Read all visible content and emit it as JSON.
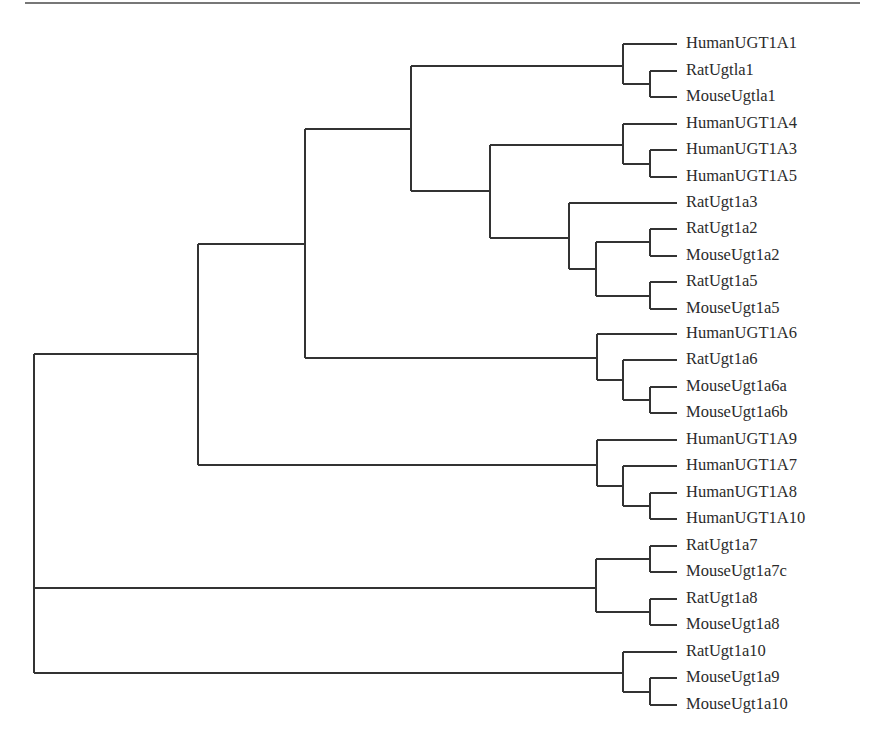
{
  "figure": {
    "type": "phylogenetic-tree",
    "orientation": "left-to-right",
    "line_color": "#333333",
    "top_rule": {
      "x1": 25,
      "x2": 860,
      "y": 3
    }
  },
  "leaves": [
    {
      "label": "HumanUGT1A1",
      "y": 44
    },
    {
      "label": "RatUgtla1",
      "y": 71
    },
    {
      "label": "MouseUgtla1",
      "y": 97
    },
    {
      "label": "HumanUGT1A4",
      "y": 124
    },
    {
      "label": "HumanUGT1A3",
      "y": 150
    },
    {
      "label": "HumanUGT1A5",
      "y": 177
    },
    {
      "label": "RatUgt1a3",
      "y": 203
    },
    {
      "label": "RatUgt1a2",
      "y": 229
    },
    {
      "label": "MouseUgt1a2",
      "y": 256
    },
    {
      "label": "RatUgt1a5",
      "y": 282
    },
    {
      "label": "MouseUgt1a5",
      "y": 309
    },
    {
      "label": "HumanUGT1A6",
      "y": 334
    },
    {
      "label": "RatUgt1a6",
      "y": 360
    },
    {
      "label": "MouseUgt1a6a",
      "y": 387
    },
    {
      "label": "MouseUgt1a6b",
      "y": 413
    },
    {
      "label": "HumanUGT1A9",
      "y": 440
    },
    {
      "label": "HumanUGT1A7",
      "y": 466
    },
    {
      "label": "HumanUGT1A8",
      "y": 493
    },
    {
      "label": "HumanUGT1A10",
      "y": 519
    },
    {
      "label": "RatUgt1a7",
      "y": 546
    },
    {
      "label": "MouseUgt1a7c",
      "y": 572
    },
    {
      "label": "RatUgt1a8",
      "y": 599
    },
    {
      "label": "MouseUgt1a8",
      "y": 625
    },
    {
      "label": "RatUgt1a10",
      "y": 652
    },
    {
      "label": "MouseUgt1a9",
      "y": 678
    },
    {
      "label": "MouseUgt1a10",
      "y": 705
    }
  ],
  "leaf_tip_x": 677,
  "label_x": 686,
  "nodes": [
    {
      "id": "root",
      "x": 34,
      "y_top": 354,
      "y_bottom": 673,
      "children": [
        {
          "y": 354,
          "to_x": 198
        },
        {
          "y": 588,
          "to_x": 596
        },
        {
          "y": 673,
          "to_x": 623
        }
      ]
    },
    {
      "id": "n198",
      "x": 198,
      "y_top": 244,
      "y_bottom": 465,
      "children": [
        {
          "y": 244,
          "to_x": 305
        },
        {
          "y": 465,
          "to_x": 597
        }
      ]
    },
    {
      "id": "n305",
      "x": 305,
      "y_top": 129,
      "y_bottom": 358,
      "children": [
        {
          "y": 129,
          "to_x": 411
        },
        {
          "y": 358,
          "to_x": 597
        }
      ]
    },
    {
      "id": "n411",
      "x": 411,
      "y_top": 66,
      "y_bottom": 191,
      "children": [
        {
          "y": 66,
          "to_x": 623
        },
        {
          "y": 191,
          "to_x": 490
        }
      ]
    },
    {
      "id": "n490",
      "x": 490,
      "y_top": 145,
      "y_bottom": 238,
      "children": [
        {
          "y": 145,
          "to_x": 623
        },
        {
          "y": 238,
          "to_x": 569
        }
      ]
    },
    {
      "id": "g1a1",
      "x": 623,
      "y_top": 44,
      "y_bottom": 84,
      "children": [
        {
          "y": 44,
          "to_x": 677
        },
        {
          "y": 84,
          "to_x": 650
        }
      ]
    },
    {
      "id": "g1a1s",
      "x": 650,
      "y_top": 71,
      "y_bottom": 97,
      "children": [
        {
          "y": 71,
          "to_x": 677
        },
        {
          "y": 97,
          "to_x": 677
        }
      ]
    },
    {
      "id": "g1a4",
      "x": 623,
      "y_top": 124,
      "y_bottom": 164,
      "children": [
        {
          "y": 124,
          "to_x": 677
        },
        {
          "y": 164,
          "to_x": 650
        }
      ]
    },
    {
      "id": "g1a4s",
      "x": 650,
      "y_top": 150,
      "y_bottom": 177,
      "children": [
        {
          "y": 150,
          "to_x": 677
        },
        {
          "y": 177,
          "to_x": 677
        }
      ]
    },
    {
      "id": "g1a3",
      "x": 569,
      "y_top": 203,
      "y_bottom": 269,
      "children": [
        {
          "y": 203,
          "to_x": 677
        },
        {
          "y": 269,
          "to_x": 596
        }
      ]
    },
    {
      "id": "g1a25",
      "x": 596,
      "y_top": 242,
      "y_bottom": 296,
      "children": [
        {
          "y": 242,
          "to_x": 650
        },
        {
          "y": 296,
          "to_x": 650
        }
      ]
    },
    {
      "id": "g1a2",
      "x": 650,
      "y_top": 229,
      "y_bottom": 256,
      "children": [
        {
          "y": 229,
          "to_x": 677
        },
        {
          "y": 256,
          "to_x": 677
        }
      ]
    },
    {
      "id": "g1a5",
      "x": 650,
      "y_top": 282,
      "y_bottom": 309,
      "children": [
        {
          "y": 282,
          "to_x": 677
        },
        {
          "y": 309,
          "to_x": 677
        }
      ]
    },
    {
      "id": "g1a6",
      "x": 597,
      "y_top": 334,
      "y_bottom": 380,
      "children": [
        {
          "y": 334,
          "to_x": 677
        },
        {
          "y": 380,
          "to_x": 623
        }
      ]
    },
    {
      "id": "g1a6r",
      "x": 623,
      "y_top": 360,
      "y_bottom": 400,
      "children": [
        {
          "y": 360,
          "to_x": 677
        },
        {
          "y": 400,
          "to_x": 650
        }
      ]
    },
    {
      "id": "g1a6m",
      "x": 650,
      "y_top": 387,
      "y_bottom": 413,
      "children": [
        {
          "y": 387,
          "to_x": 677
        },
        {
          "y": 413,
          "to_x": 677
        }
      ]
    },
    {
      "id": "g1a9",
      "x": 597,
      "y_top": 440,
      "y_bottom": 486,
      "children": [
        {
          "y": 440,
          "to_x": 677
        },
        {
          "y": 486,
          "to_x": 623
        }
      ]
    },
    {
      "id": "g1a7",
      "x": 623,
      "y_top": 466,
      "y_bottom": 506,
      "children": [
        {
          "y": 466,
          "to_x": 677
        },
        {
          "y": 506,
          "to_x": 650
        }
      ]
    },
    {
      "id": "g1a8",
      "x": 650,
      "y_top": 493,
      "y_bottom": 519,
      "children": [
        {
          "y": 493,
          "to_x": 677
        },
        {
          "y": 519,
          "to_x": 677
        }
      ]
    },
    {
      "id": "g7_8",
      "x": 596,
      "y_top": 559,
      "y_bottom": 612,
      "children": [
        {
          "y": 559,
          "to_x": 650
        },
        {
          "y": 612,
          "to_x": 650
        }
      ]
    },
    {
      "id": "g7",
      "x": 650,
      "y_top": 546,
      "y_bottom": 572,
      "children": [
        {
          "y": 546,
          "to_x": 677
        },
        {
          "y": 572,
          "to_x": 677
        }
      ]
    },
    {
      "id": "g8",
      "x": 650,
      "y_top": 599,
      "y_bottom": 625,
      "children": [
        {
          "y": 599,
          "to_x": 677
        },
        {
          "y": 625,
          "to_x": 677
        }
      ]
    },
    {
      "id": "g10",
      "x": 623,
      "y_top": 652,
      "y_bottom": 692,
      "children": [
        {
          "y": 652,
          "to_x": 677
        },
        {
          "y": 692,
          "to_x": 650
        }
      ]
    },
    {
      "id": "g9_10",
      "x": 650,
      "y_top": 678,
      "y_bottom": 705,
      "children": [
        {
          "y": 678,
          "to_x": 677
        },
        {
          "y": 705,
          "to_x": 677
        }
      ]
    }
  ]
}
